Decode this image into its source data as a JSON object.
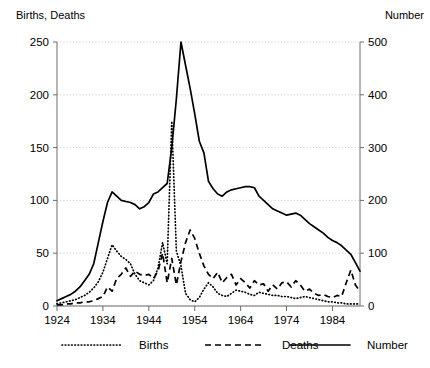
{
  "chart_data": {
    "type": "line",
    "title": "",
    "xlabel": "",
    "ylabel": "Births, Deaths",
    "y2label": "Number",
    "xlim": [
      1924,
      1990
    ],
    "ylim": [
      0,
      250
    ],
    "y2lim": [
      0,
      500
    ],
    "grid": true,
    "legend_position": "bottom",
    "y_ticks": [
      0,
      50,
      100,
      150,
      200,
      250
    ],
    "y_tick_labels": [
      "0",
      "50",
      "100",
      "150",
      "200",
      "250"
    ],
    "y2_ticks": [
      0,
      100,
      200,
      300,
      400,
      500
    ],
    "y2_tick_labels": [
      "0",
      "100",
      "200",
      "300",
      "400",
      "500"
    ],
    "x_ticks": [
      1924,
      1934,
      1944,
      1954,
      1964,
      1974,
      1984
    ],
    "x_tick_labels": [
      "1924",
      "1934",
      "1944",
      "1954",
      "1964",
      "1974",
      "1984"
    ],
    "x": [
      1924,
      1925,
      1926,
      1927,
      1928,
      1929,
      1930,
      1931,
      1932,
      1933,
      1934,
      1935,
      1936,
      1937,
      1938,
      1939,
      1940,
      1941,
      1942,
      1943,
      1944,
      1945,
      1946,
      1947,
      1948,
      1949,
      1950,
      1951,
      1952,
      1953,
      1954,
      1955,
      1956,
      1957,
      1958,
      1959,
      1960,
      1961,
      1962,
      1963,
      1964,
      1965,
      1966,
      1967,
      1968,
      1969,
      1970,
      1971,
      1972,
      1973,
      1974,
      1975,
      1976,
      1977,
      1978,
      1979,
      1980,
      1981,
      1982,
      1983,
      1984,
      1985,
      1986,
      1987,
      1988,
      1989,
      1990
    ],
    "series": [
      {
        "name": "Births",
        "style": "dotted",
        "axis": "left",
        "values": [
          2,
          3,
          4,
          5,
          6,
          8,
          10,
          13,
          17,
          23,
          32,
          45,
          58,
          52,
          47,
          44,
          40,
          30,
          24,
          22,
          20,
          24,
          36,
          60,
          40,
          175,
          52,
          38,
          12,
          6,
          4,
          8,
          16,
          22,
          18,
          12,
          10,
          9,
          12,
          15,
          14,
          13,
          11,
          10,
          13,
          12,
          11,
          10,
          10,
          9,
          9,
          8,
          7,
          8,
          9,
          8,
          7,
          6,
          5,
          4,
          4,
          3,
          3,
          2,
          2,
          2,
          2
        ]
      },
      {
        "name": "Deaths",
        "style": "dashed",
        "axis": "left",
        "values": [
          1,
          1,
          2,
          2,
          3,
          3,
          4,
          4,
          5,
          7,
          9,
          18,
          14,
          26,
          30,
          36,
          28,
          33,
          30,
          29,
          30,
          26,
          33,
          50,
          22,
          45,
          20,
          42,
          60,
          72,
          64,
          50,
          38,
          30,
          26,
          32,
          22,
          27,
          30,
          20,
          26,
          22,
          17,
          24,
          20,
          21,
          14,
          20,
          16,
          22,
          23,
          18,
          24,
          20,
          14,
          16,
          12,
          10,
          11,
          9,
          8,
          10,
          9,
          22,
          34,
          20,
          14
        ]
      },
      {
        "name": "Number",
        "style": "solid",
        "axis": "right",
        "values": [
          10,
          14,
          18,
          22,
          28,
          36,
          48,
          60,
          80,
          120,
          160,
          196,
          216,
          208,
          200,
          198,
          196,
          192,
          184,
          188,
          196,
          212,
          216,
          224,
          232,
          300,
          392,
          500,
          456,
          412,
          364,
          312,
          290,
          236,
          222,
          212,
          208,
          216,
          220,
          222,
          224,
          226,
          226,
          224,
          208,
          200,
          192,
          184,
          180,
          176,
          172,
          174,
          176,
          172,
          164,
          156,
          150,
          144,
          138,
          130,
          124,
          120,
          114,
          106,
          98,
          82,
          66
        ]
      }
    ],
    "legend": [
      {
        "label": "Births",
        "style": "dotted"
      },
      {
        "label": "Deaths",
        "style": "dashed"
      },
      {
        "label": "Number",
        "style": "solid"
      }
    ]
  },
  "layout": {
    "plot": {
      "left": 57,
      "right": 360,
      "top": 42,
      "bottom": 306
    }
  }
}
